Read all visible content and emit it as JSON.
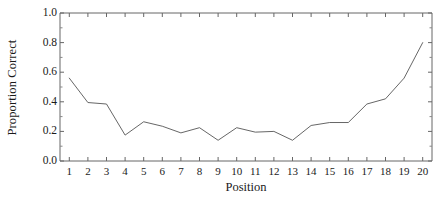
{
  "chart_data": {
    "type": "line",
    "title": "",
    "xlabel": "Position",
    "ylabel": "Proportion Correct",
    "x": [
      1,
      2,
      3,
      4,
      5,
      6,
      7,
      8,
      9,
      10,
      11,
      12,
      13,
      14,
      15,
      16,
      17,
      18,
      19,
      20
    ],
    "values": [
      0.56,
      0.395,
      0.385,
      0.175,
      0.265,
      0.235,
      0.19,
      0.225,
      0.14,
      0.225,
      0.195,
      0.2,
      0.14,
      0.24,
      0.26,
      0.26,
      0.385,
      0.42,
      0.56,
      0.8
    ],
    "series": [
      {
        "name": "Proportion Correct",
        "values": [
          0.56,
          0.395,
          0.385,
          0.175,
          0.265,
          0.235,
          0.19,
          0.225,
          0.14,
          0.225,
          0.195,
          0.2,
          0.14,
          0.24,
          0.26,
          0.26,
          0.385,
          0.42,
          0.56,
          0.8
        ]
      }
    ],
    "xtick_labels": [
      "1",
      "2",
      "3",
      "4",
      "5",
      "6",
      "7",
      "8",
      "9",
      "10",
      "11",
      "12",
      "13",
      "14",
      "15",
      "16",
      "17",
      "18",
      "19",
      "20"
    ],
    "ytick_labels": [
      "0.0",
      "0.2",
      "0.4",
      "0.6",
      "0.8",
      "1.0"
    ],
    "ytick_values": [
      0.0,
      0.2,
      0.4,
      0.6,
      0.8,
      1.0
    ],
    "xlim": [
      0.5,
      20.5
    ],
    "ylim": [
      0.0,
      1.0
    ],
    "grid": false,
    "legend": false,
    "line_color": "#555555",
    "axis_color": "#555555",
    "background_color": "#ffffff"
  }
}
